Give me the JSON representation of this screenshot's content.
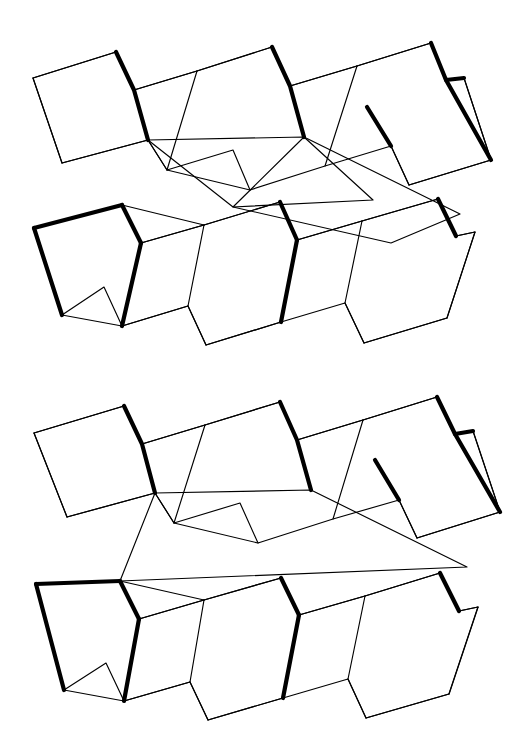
{
  "document": {
    "title": "Folded Strip Diagrams",
    "background_color": "#ffffff",
    "line_color": "#000000",
    "face_color": "#ffffff",
    "width": 530,
    "height": 740,
    "figure_count": 2
  },
  "style": {
    "thin_stroke_width": 1.15,
    "bold_stroke_width": 4.2,
    "bold_edge_meaning": "mountain-fold",
    "thin_edge_meaning": "valley-fold-or-outline"
  },
  "figures": [
    {
      "id": "figure-top",
      "label": "Top folded strip diagram",
      "description": "Accordion-folded paper strip in isometric projection with an offset diagonal split through the central band",
      "upper_band": {
        "label": "Upper accordion row",
        "panel_count": 7,
        "outline": "M33,78 L116,52 L134,90 L197,71 L272,47 L290,86 L357,66 L431,43 L446,80 L464,78 L491,160 L409,185 L391,146 L325,166 L250,190 L233,150 L167,170 L148,140 L62,163 Z",
        "bold_edges": [
          "M116,52 L134,90 L148,140",
          "M272,47 L290,86 L304,137",
          "M431,43 L446,80 L464,78",
          "M446,80 L491,160",
          "M367,107 L391,146"
        ],
        "thin_edges": [
          "M33,78 L116,52",
          "M33,78 L62,163",
          "M62,163 L148,140",
          "M134,90 L197,71",
          "M197,71 L167,170",
          "M167,170 L148,140",
          "M197,71 L272,47",
          "M250,190 L167,170",
          "M290,86 L357,66",
          "M357,66 L325,166",
          "M357,66 L431,43",
          "M464,78 L491,160",
          "M491,160 L409,185",
          "M409,185 L391,146"
        ]
      },
      "middle_band": {
        "label": "Central connecting band, diagonally split",
        "split": true,
        "left_segment": "M148,140 L304,137 L373,200 L233,207 Z",
        "right_segment": "M304,137 L460,214 L391,243 L233,207 Z"
      },
      "lower_band": {
        "label": "Lower accordion row",
        "panel_count": 7,
        "outline": "M34,228 L122,205 L141,243 L204,225 L280,202 L297,240 L362,221 L438,199 L456,236 L475,232 L447,318 L364,343 L345,303 L281,322 L206,345 L188,306 L122,326 L104,287 L62,315 Z",
        "bold_edges": [
          "M34,228 L122,205",
          "M34,228 L62,315",
          "M122,205 L141,243",
          "M280,202 L297,240",
          "M297,240 L281,322",
          "M438,199 L456,236",
          "M141,243 L122,326"
        ],
        "thin_edges": [
          "M122,205 L204,225",
          "M62,315 L122,326",
          "M141,243 L204,225",
          "M204,225 L188,306",
          "M188,306 L122,326",
          "M204,225 L280,202",
          "M206,345 L188,306",
          "M297,240 L362,221",
          "M362,221 L345,303",
          "M362,221 L438,199",
          "M456,236 L475,232",
          "M475,232 L447,318",
          "M447,318 L364,343",
          "M364,343 L345,303",
          "M281,322 L206,345"
        ]
      }
    },
    {
      "id": "figure-bottom",
      "label": "Bottom folded strip diagram",
      "description": "Accordion-folded paper strip in isometric projection with a single continuous central band",
      "upper_band": {
        "label": "Upper accordion row",
        "panel_count": 7,
        "outline": "M34,433 L124,406 L142,444 L205,425 L280,402 L297,440 L363,420 L437,397 L455,434 L473,431 L500,512 L417,538 L399,500 L333,519 L258,543 L240,503 L174,523 L155,493 L67,517 Z",
        "bold_edges": [
          "M124,406 L142,444 L155,493",
          "M280,402 L297,440 L311,490",
          "M437,397 L455,434 L473,431",
          "M455,434 L500,512",
          "M375,460 L399,500"
        ],
        "thin_edges": [
          "M34,433 L124,406",
          "M34,433 L67,517",
          "M67,517 L155,493",
          "M142,444 L205,425",
          "M205,425 L174,523",
          "M174,523 L155,493",
          "M205,425 L280,402",
          "M258,543 L174,523",
          "M297,440 L363,420",
          "M363,420 L333,519",
          "M363,420 L437,397",
          "M473,431 L500,512",
          "M500,512 L417,538",
          "M417,538 L399,500"
        ]
      },
      "middle_band": {
        "label": "Central connecting band, continuous",
        "split": false,
        "segment": "M155,493 L311,490 L467,567 L120,581 Z"
      },
      "lower_band": {
        "label": "Lower accordion row",
        "panel_count": 7,
        "outline": "M36,584 L120,581 L139,619 L204,600 L281,578 L299,615 L365,596 L440,573 L459,611 L478,607 L449,694 L366,718 L348,679 L283,698 L208,720 L190,682 L124,701 L106,663 L64,690 Z",
        "bold_edges": [
          "M36,584 L120,581",
          "M36,584 L64,690",
          "M120,581 L139,619",
          "M281,578 L299,615",
          "M299,615 L283,698",
          "M440,573 L459,611",
          "M139,619 L124,701"
        ],
        "thin_edges": [
          "M120,581 L204,600",
          "M64,690 L124,701",
          "M139,619 L204,600",
          "M204,600 L190,682",
          "M190,682 L124,701",
          "M204,600 L281,578",
          "M208,720 L190,682",
          "M299,615 L365,596",
          "M365,596 L348,679",
          "M365,596 L440,573",
          "M459,611 L478,607",
          "M478,607 L449,694",
          "M449,694 L366,718",
          "M366,718 L348,679",
          "M283,698 L208,720"
        ]
      }
    }
  ]
}
